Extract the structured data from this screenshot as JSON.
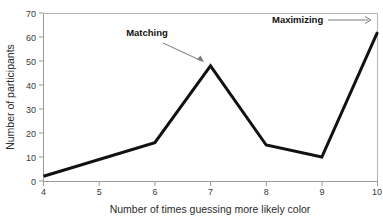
{
  "chart_data": {
    "type": "line",
    "title": "",
    "subtitle": "",
    "xlabel": "Number of times guessing more likely color",
    "ylabel": "Number of participants",
    "x": [
      4,
      5,
      6,
      7,
      8,
      9,
      10
    ],
    "values": [
      2,
      9,
      16,
      48,
      15,
      10,
      62
    ],
    "series": [
      {
        "name": "Number of participants",
        "values": [
          2,
          9,
          16,
          48,
          15,
          10,
          62
        ]
      }
    ],
    "vertices_x": [
      4,
      6,
      7,
      8,
      9,
      10
    ],
    "vertices_y": [
      2,
      16,
      48,
      15,
      10,
      62
    ],
    "xlim": [
      4,
      10
    ],
    "ylim": [
      0,
      70
    ],
    "x_ticks": [
      "4",
      "5",
      "6",
      "7",
      "8",
      "9",
      "10"
    ],
    "y_ticks": [
      "0",
      "10",
      "20",
      "30",
      "40",
      "50",
      "60",
      "70"
    ],
    "grid": false,
    "legend": "none",
    "line_color": "#111111",
    "line_width": 3,
    "axis_color": "#9a9a9a",
    "annotations": [
      {
        "name": "matching",
        "label": "Matching",
        "text_x": 147,
        "text_y": 36,
        "arrow_from_x": 163,
        "arrow_from_y": 43,
        "arrow_to_x": 204,
        "arrow_to_y": 62,
        "arrow_style": "diagonal-down-right",
        "points_at_x": 7,
        "points_at_y": 48
      },
      {
        "name": "maximizing",
        "label": "Maximizing",
        "text_x": 272,
        "text_y": 23,
        "arrow_from_x": 328,
        "arrow_from_y": 20,
        "arrow_to_x": 371,
        "arrow_to_y": 20,
        "arrow_style": "horizontal-right",
        "points_at_x": 10,
        "points_at_y": 62
      }
    ]
  }
}
